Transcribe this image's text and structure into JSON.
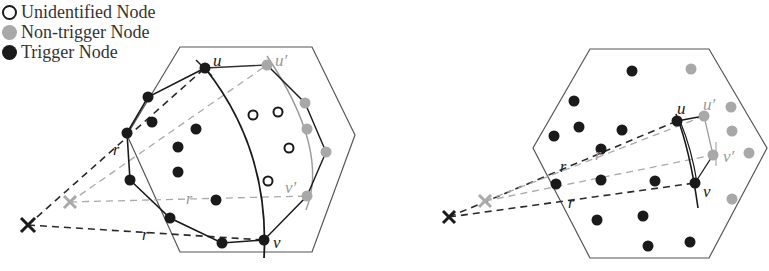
{
  "legend": {
    "items": [
      {
        "label": "Unidentified Node",
        "type": "unidentified"
      },
      {
        "label": "Non-trigger Node",
        "type": "nontrigger"
      },
      {
        "label": "Trigger Node",
        "type": "trigger"
      }
    ]
  },
  "colors": {
    "trigger": "#1a1a1a",
    "nontrigger": "#a8a8a8",
    "unidentified_stroke": "#1a1a1a",
    "hex": "#555555",
    "dark_dash": "#2a2a2a",
    "light_dash": "#aaaaaa"
  },
  "labels": {
    "u": "u",
    "u_prime": "u′",
    "v": "v",
    "v_prime": "v′",
    "r": "r"
  },
  "left_diagram": {
    "hexagon": [
      [
        180,
        47
      ],
      [
        312,
        47
      ],
      [
        355,
        135
      ],
      [
        312,
        252
      ],
      [
        180,
        252
      ],
      [
        127,
        135
      ]
    ],
    "observer_dark": [
      28,
      225
    ],
    "observer_light": [
      70,
      202
    ],
    "u": [
      205,
      68
    ],
    "u_prime": [
      267,
      65
    ],
    "v": [
      264,
      240
    ],
    "v_prime": [
      307,
      196
    ],
    "trigger_nodes": [
      [
        205,
        68
      ],
      [
        148,
        97
      ],
      [
        127,
        133
      ],
      [
        130,
        180
      ],
      [
        170,
        218
      ],
      [
        222,
        243
      ],
      [
        264,
        240
      ],
      [
        152,
        122
      ],
      [
        178,
        147
      ],
      [
        196,
        129
      ],
      [
        178,
        172
      ],
      [
        216,
        200
      ]
    ],
    "boundary_path": [
      [
        205,
        68
      ],
      [
        148,
        97
      ],
      [
        127,
        133
      ],
      [
        130,
        180
      ],
      [
        170,
        218
      ],
      [
        222,
        243
      ],
      [
        264,
        240
      ]
    ],
    "nontrigger_nodes": [
      [
        267,
        65
      ],
      [
        305,
        103
      ],
      [
        307,
        129
      ],
      [
        326,
        152
      ],
      [
        307,
        196
      ]
    ],
    "outer_path": [
      [
        267,
        65
      ],
      [
        305,
        103
      ],
      [
        326,
        152
      ],
      [
        307,
        196
      ],
      [
        264,
        240
      ]
    ],
    "unidentified_nodes": [
      [
        253,
        115
      ],
      [
        278,
        112
      ],
      [
        289,
        148
      ],
      [
        268,
        181
      ]
    ]
  },
  "right_diagram": {
    "hexagon": [
      [
        590,
        49
      ],
      [
        709,
        49
      ],
      [
        767,
        148
      ],
      [
        709,
        258
      ],
      [
        590,
        258
      ],
      [
        533,
        148
      ]
    ],
    "observer_dark": [
      449,
      217
    ],
    "observer_light": [
      485,
      201
    ],
    "u": [
      677,
      121
    ],
    "u_prime": [
      704,
      116
    ],
    "v": [
      695,
      183
    ],
    "v_prime": [
      713,
      155
    ],
    "trigger_nodes": [
      [
        632,
        71
      ],
      [
        574,
        101
      ],
      [
        579,
        127
      ],
      [
        554,
        136
      ],
      [
        622,
        130
      ],
      [
        601,
        149
      ],
      [
        556,
        184
      ],
      [
        601,
        180
      ],
      [
        655,
        181
      ],
      [
        597,
        220
      ],
      [
        643,
        216
      ],
      [
        648,
        246
      ],
      [
        690,
        242
      ],
      [
        677,
        121
      ],
      [
        695,
        183
      ]
    ],
    "nontrigger_nodes": [
      [
        691,
        69
      ],
      [
        704,
        116
      ],
      [
        731,
        107
      ],
      [
        732,
        131
      ],
      [
        713,
        155
      ],
      [
        749,
        153
      ],
      [
        732,
        199
      ]
    ]
  }
}
